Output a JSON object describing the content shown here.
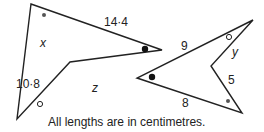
{
  "diagram": {
    "shape_a": {
      "vertices": [
        [
          31,
          4
        ],
        [
          162,
          50
        ],
        [
          70,
          62
        ],
        [
          17,
          119
        ]
      ],
      "labels": {
        "top_edge": "14·4",
        "upper_left_edge": "x",
        "lower_left_edge": "10·8",
        "bottom_edge": "z"
      },
      "angle_marks": [
        "small filled dot at top vertex",
        "filled dot at right tip",
        "open circle at bottom-left vertex"
      ]
    },
    "shape_b": {
      "vertices": [
        [
          253,
          20
        ],
        [
          211,
          66
        ],
        [
          242,
          113
        ],
        [
          137,
          78
        ]
      ],
      "labels": {
        "top_edge": "9",
        "upper_right_edge": "y",
        "lower_right_edge": "5",
        "bottom_edge": "8"
      },
      "angle_marks": [
        "open circle at top-right vertex",
        "filled dot at left tip",
        "small filled dot at bottom-right vertex"
      ]
    },
    "caption": "All lengths are in centimetres."
  }
}
